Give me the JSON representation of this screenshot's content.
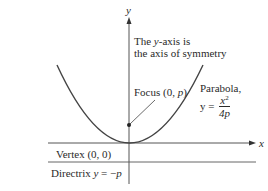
{
  "diagram": {
    "axes": {
      "x_label": "x",
      "y_label": "y"
    },
    "annotations": {
      "symmetry_line1_a": "The ",
      "symmetry_line1_var": "y",
      "symmetry_line1_b": "-axis is",
      "symmetry_line2": "the axis of symmetry",
      "focus_a": "Focus (0, ",
      "focus_var": "p",
      "focus_b": ")",
      "parabola_name": "Parabola,",
      "parabola_eq_lhs": "y =",
      "parabola_eq_num": "x",
      "parabola_eq_num_exp": "2",
      "parabola_eq_den": "4p",
      "vertex": "Vertex (0, 0)",
      "directrix_a": "Directrix ",
      "directrix_var": "y",
      "directrix_b": " = −",
      "directrix_var2": "p"
    },
    "points": {
      "vertex": {
        "label": "Vertex",
        "coords": "(0, 0)"
      },
      "focus": {
        "label": "Focus",
        "coords": "(0, p)"
      }
    },
    "colors": {
      "ink": "#2a2a2a",
      "line": "#555555",
      "background": "#ffffff"
    }
  }
}
